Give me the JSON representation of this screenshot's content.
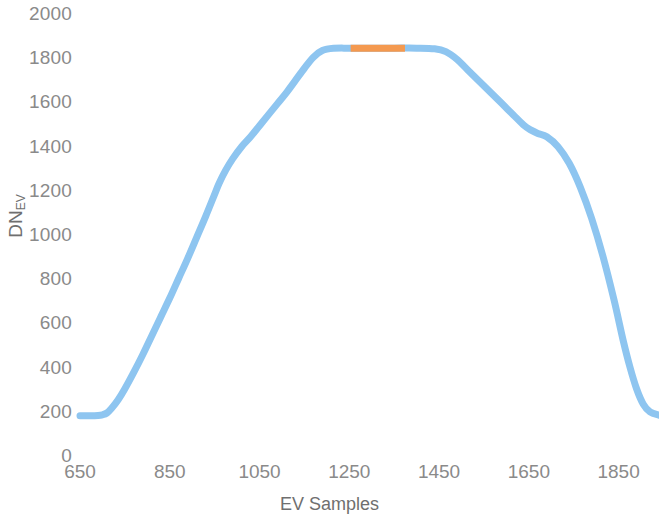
{
  "chart_data": {
    "type": "line",
    "title": "",
    "xlabel": "EV Samples",
    "ylabel": "DN_EV",
    "ylabel_base": "DN",
    "ylabel_sub": "EV",
    "xlim": [
      650,
      1940
    ],
    "ylim": [
      0,
      2000
    ],
    "xticks": [
      650,
      850,
      1050,
      1250,
      1450,
      1650,
      1850
    ],
    "yticks": [
      0,
      200,
      400,
      600,
      800,
      1000,
      1200,
      1400,
      1600,
      1800,
      2000
    ],
    "grid": false,
    "legend": "none",
    "colors": {
      "line": "#8EC5F0",
      "highlight": "#F4994F",
      "axis_text": "#8a8a8a",
      "title_text": "#6f6f6f",
      "background": "#ffffff"
    },
    "series": [
      {
        "name": "EV response",
        "color": "#8EC5F0",
        "x": [
          650,
          670,
          690,
          700,
          710,
          720,
          735,
          750,
          770,
          790,
          810,
          830,
          850,
          870,
          890,
          910,
          930,
          950,
          960,
          975,
          990,
          1010,
          1030,
          1050,
          1070,
          1090,
          1110,
          1130,
          1150,
          1170,
          1190,
          1215,
          1250,
          1300,
          1350,
          1400,
          1440,
          1465,
          1490,
          1515,
          1540,
          1565,
          1590,
          1615,
          1640,
          1655,
          1670,
          1690,
          1715,
          1740,
          1765,
          1790,
          1815,
          1840,
          1860,
          1875,
          1890,
          1905,
          1920,
          1940
        ],
        "y": [
          178,
          178,
          179,
          182,
          190,
          210,
          250,
          300,
          375,
          455,
          540,
          625,
          710,
          800,
          890,
          985,
          1080,
          1180,
          1230,
          1290,
          1340,
          1395,
          1440,
          1490,
          1540,
          1590,
          1640,
          1695,
          1750,
          1800,
          1830,
          1840,
          1841,
          1841,
          1841,
          1841,
          1838,
          1825,
          1790,
          1740,
          1690,
          1640,
          1590,
          1540,
          1490,
          1470,
          1455,
          1440,
          1395,
          1320,
          1210,
          1070,
          900,
          700,
          520,
          400,
          300,
          230,
          195,
          180
        ]
      },
      {
        "name": "Highlighted EV samples",
        "color": "#F4994F",
        "x_range": [
          1253,
          1374
        ],
        "y": 1841
      }
    ]
  },
  "axes": {
    "y_title": "DN",
    "y_title_sub": "EV",
    "x_title": "EV Samples",
    "y_tick_labels": [
      "2000",
      "1800",
      "1600",
      "1400",
      "1200",
      "1000",
      "800",
      "600",
      "400",
      "200",
      "0"
    ],
    "x_tick_labels": [
      "650",
      "850",
      "1050",
      "1250",
      "1450",
      "1650",
      "1850"
    ]
  }
}
